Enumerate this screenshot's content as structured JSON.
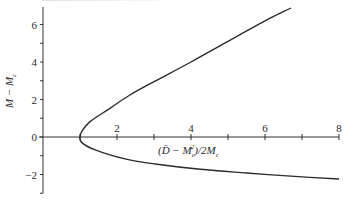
{
  "chart_data": {
    "type": "line",
    "title": "",
    "xlabel": "(D̄ − M_c²)/2M_c",
    "ylabel": "M − M_c",
    "xlim": [
      0,
      8
    ],
    "ylim": [
      -2.8,
      7.2
    ],
    "x_ticks": [
      0,
      1,
      2,
      3,
      4,
      5,
      6,
      7,
      8
    ],
    "x_tick_labels": [
      "",
      "",
      "2",
      "",
      "4",
      "",
      "6",
      "",
      "8"
    ],
    "y_ticks": [
      -3,
      -2,
      -1,
      0,
      1,
      2,
      3,
      4,
      5,
      6
    ],
    "y_tick_labels": [
      "",
      "−2",
      "",
      "0",
      "",
      "2",
      "",
      "4",
      "",
      "6"
    ],
    "grid": false,
    "legend": null,
    "axes_crossing_at_origin": true,
    "series": [
      {
        "name": "upper branch",
        "x": [
          1.0,
          1.05,
          1.27,
          1.81,
          2.35,
          3.0,
          4.0,
          5.0,
          6.0,
          6.7
        ],
        "y": [
          0.0,
          0.3,
          0.82,
          1.53,
          2.24,
          2.95,
          4.0,
          5.1,
          6.19,
          6.88
        ]
      },
      {
        "name": "lower branch",
        "x": [
          1.0,
          1.05,
          1.41,
          2.22,
          3.03,
          4.25,
          5.5,
          6.8,
          8.0
        ],
        "y": [
          0.0,
          -0.3,
          -0.69,
          -1.17,
          -1.44,
          -1.72,
          -1.92,
          -2.1,
          -2.24
        ]
      }
    ]
  },
  "labels": {
    "xlabel_main": "(D̄ − M",
    "xlabel_sub": "c",
    "xlabel_sup": "2",
    "xlabel_tail": ")/2M",
    "xlabel_tail_sub": "c",
    "ylabel_main": "M − M",
    "ylabel_sub": "c"
  }
}
